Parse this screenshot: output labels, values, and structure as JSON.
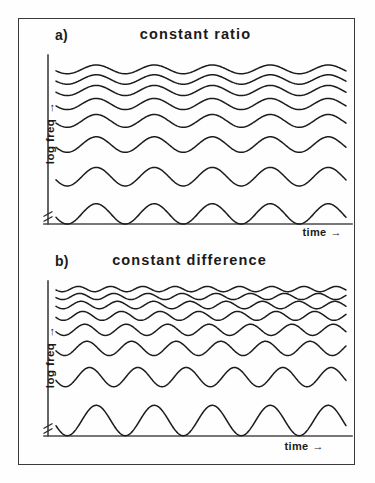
{
  "figure": {
    "background_color": "#fefefe",
    "frame_color": "#3a3a3a",
    "trace_color": "#1c1c1c",
    "axis_color": "#4a4a4a"
  },
  "panels": [
    {
      "label": "a)",
      "title": "constant ratio",
      "ylabel": "log freq",
      "ylabel_arrow": "→",
      "xlabel": "time",
      "xlabel_arrow": "→",
      "trace_count": 8
    },
    {
      "label": "b)",
      "title": "constant difference",
      "ylabel": "log freq",
      "ylabel_arrow": "→",
      "xlabel": "time",
      "xlabel_arrow": "→",
      "trace_count": 8
    }
  ],
  "chart_data": [
    {
      "type": "line",
      "title": "constant ratio",
      "panel": "a)",
      "xlabel": "time",
      "ylabel": "log freq",
      "grid": false,
      "legend": "none",
      "axis_break_y": true,
      "description": "Eight stacked sinusoidal traces. Components spaced by a constant frequency ratio appear equally spaced on a logarithmic frequency axis; every trace modulates at the same period (5 cycles across the time window), with amplitude (on the log axis) shrinking for higher components so the upper traces crowd together.",
      "x": [
        0,
        1
      ],
      "series": [
        {
          "name": "trace-1-lowest",
          "baseline": 0.06,
          "cycles": 5.0,
          "amplitude": 0.06,
          "phase_deg": 200
        },
        {
          "name": "trace-2",
          "baseline": 0.28,
          "cycles": 5.0,
          "amplitude": 0.055,
          "phase_deg": 200
        },
        {
          "name": "trace-3",
          "baseline": 0.47,
          "cycles": 5.0,
          "amplitude": 0.046,
          "phase_deg": 200
        },
        {
          "name": "trace-4",
          "baseline": 0.61,
          "cycles": 5.0,
          "amplitude": 0.038,
          "phase_deg": 200
        },
        {
          "name": "trace-5",
          "baseline": 0.71,
          "cycles": 5.0,
          "amplitude": 0.033,
          "phase_deg": 200
        },
        {
          "name": "trace-6",
          "baseline": 0.79,
          "cycles": 5.0,
          "amplitude": 0.03,
          "phase_deg": 200
        },
        {
          "name": "trace-7",
          "baseline": 0.855,
          "cycles": 5.0,
          "amplitude": 0.028,
          "phase_deg": 200
        },
        {
          "name": "trace-8-highest",
          "baseline": 0.915,
          "cycles": 5.0,
          "amplitude": 0.026,
          "phase_deg": 200
        }
      ],
      "ylim": [
        0,
        1
      ],
      "xlim": [
        0,
        1
      ]
    },
    {
      "type": "line",
      "title": "constant difference",
      "panel": "b)",
      "xlabel": "time",
      "ylabel": "log freq",
      "grid": false,
      "legend": "none",
      "axis_break_y": true,
      "description": "Eight stacked sinusoidal traces. Components spaced by a constant frequency difference bunch together on a logarithmic frequency axis; the modulation rate increases for higher components (bottom trace 5 cycles rising to about 9 cycles at the top) while amplitude shrinks rapidly.",
      "x": [
        0,
        1
      ],
      "series": [
        {
          "name": "trace-1-lowest",
          "baseline": 0.1,
          "cycles": 5.0,
          "amplitude": 0.098,
          "phase_deg": 200
        },
        {
          "name": "trace-2",
          "baseline": 0.38,
          "cycles": 6.0,
          "amplitude": 0.062,
          "phase_deg": 200
        },
        {
          "name": "trace-3",
          "baseline": 0.565,
          "cycles": 6.5,
          "amplitude": 0.046,
          "phase_deg": 200
        },
        {
          "name": "trace-4",
          "baseline": 0.685,
          "cycles": 7.0,
          "amplitude": 0.036,
          "phase_deg": 200
        },
        {
          "name": "trace-5",
          "baseline": 0.775,
          "cycles": 7.5,
          "amplitude": 0.029,
          "phase_deg": 200
        },
        {
          "name": "trace-6",
          "baseline": 0.845,
          "cycles": 8.0,
          "amplitude": 0.024,
          "phase_deg": 200
        },
        {
          "name": "trace-7",
          "baseline": 0.9,
          "cycles": 8.5,
          "amplitude": 0.02,
          "phase_deg": 200
        },
        {
          "name": "trace-8-highest",
          "baseline": 0.948,
          "cycles": 9.0,
          "amplitude": 0.017,
          "phase_deg": 200
        }
      ],
      "ylim": [
        0,
        1
      ],
      "xlim": [
        0,
        1
      ]
    }
  ]
}
